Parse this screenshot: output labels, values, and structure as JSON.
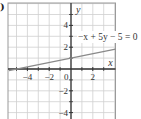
{
  "figure_label": ")",
  "chart_data": {
    "type": "line",
    "title": "",
    "xlabel": "x",
    "ylabel": "y",
    "xlim": [
      -5.7,
      4.1
    ],
    "ylim": [
      -4.6,
      6.0
    ],
    "grid": true,
    "x_ticks": [
      -4,
      -2,
      0,
      2
    ],
    "y_ticks": [
      4,
      2,
      -2,
      -4
    ],
    "x_tick_labels": [
      "−4",
      "−2",
      "0",
      "2"
    ],
    "y_tick_labels": [
      "4",
      "2",
      "−2",
      "−4"
    ],
    "series": [
      {
        "name": "−x + 5y − 5 = 0",
        "equation": "y = x/5 + 1",
        "x": [
          -5.7,
          4.1
        ],
        "y": [
          -0.14,
          1.82
        ]
      }
    ],
    "annotations": [
      {
        "text": "−x + 5y − 5 = 0",
        "x": 1.5,
        "y": 2.3
      }
    ]
  },
  "colors": {
    "grid": "#cfcfcf",
    "border": "#9a9a9a",
    "axis": "#333333",
    "line": "#8a8a8a"
  }
}
